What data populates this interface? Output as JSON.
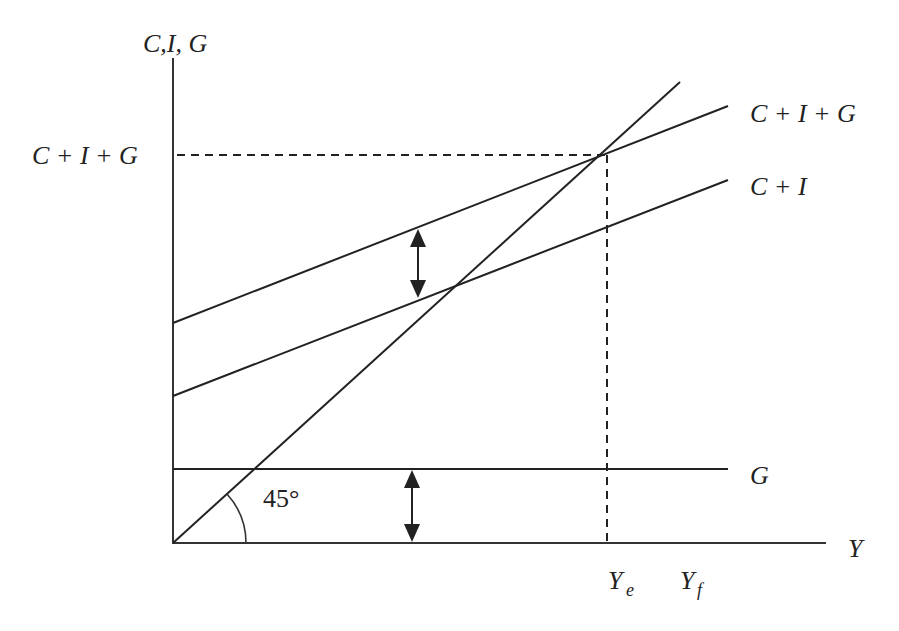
{
  "colors": {
    "ink": "#222222",
    "background": "#ffffff"
  },
  "axes": {
    "y_label": "C,I, G",
    "x_label": "Y",
    "y_tick_label": "C + I + G",
    "x_tick_labels": {
      "equilibrium": "Y",
      "equilibrium_sub": "e",
      "full_employment": "Y",
      "full_employment_sub": "f"
    }
  },
  "lines": {
    "aggregate_expenditure": {
      "label": "C + I + G"
    },
    "consumption_investment": {
      "label": "C + I"
    },
    "government": {
      "label": "G"
    },
    "forty_five_degree": {
      "angle_label": "45°"
    }
  },
  "annotations": {
    "gap_arrow_upper": "vertical double arrow showing G between C+I and C+I+G",
    "gap_arrow_lower": "vertical double arrow showing G above the Y axis"
  }
}
